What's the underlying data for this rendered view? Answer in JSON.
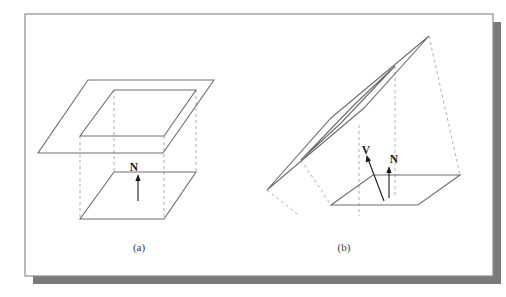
{
  "figure": {
    "frame": {
      "border_color": "#8c8c8c",
      "background_color": "#ffffff",
      "shadow_color": "#7a7a7a"
    },
    "line_color": "#6e6e6e",
    "dash_color": "#9a9a9a",
    "vector_color": "#1a1a1a",
    "panels": [
      {
        "id": "panel-a",
        "caption": "(a)",
        "description": "Plane parallel to base plane with surface normal",
        "labels": [
          {
            "name": "normal-vector-label",
            "text": "N"
          }
        ]
      },
      {
        "id": "panel-b",
        "caption": "(b)",
        "description": "Tilted plane above base plane with view vector and surface normal",
        "labels": [
          {
            "name": "view-vector-label",
            "text": "V"
          },
          {
            "name": "normal-vector-label",
            "text": "N"
          }
        ]
      }
    ]
  }
}
